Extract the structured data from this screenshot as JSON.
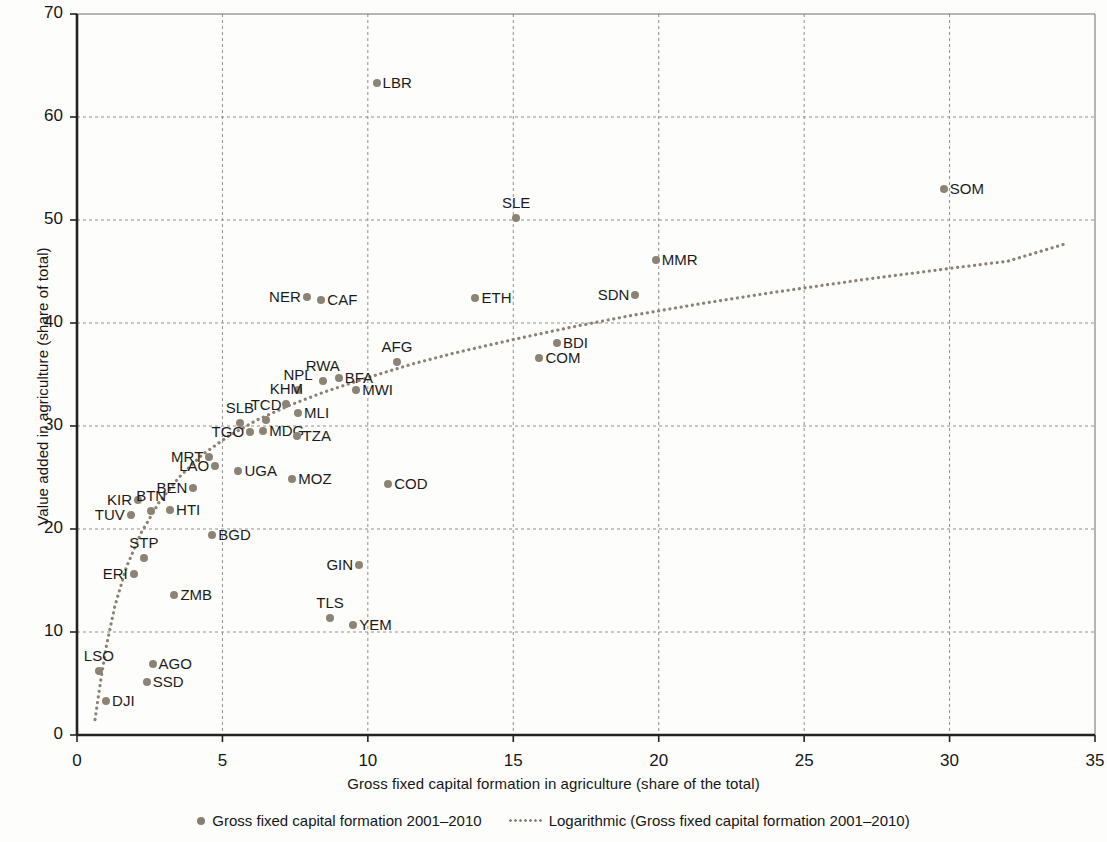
{
  "chart_data": {
    "type": "scatter",
    "title": "",
    "xlabel": "Gross fixed capital formation in agriculture (share of the total)",
    "ylabel": "Value added in agriculture (share of total)",
    "xlim": [
      0,
      35
    ],
    "ylim": [
      0,
      70
    ],
    "xticks": [
      "0",
      "5",
      "10",
      "15",
      "20",
      "25",
      "30",
      "35"
    ],
    "yticks": [
      "0",
      "10",
      "20",
      "30",
      "40",
      "50",
      "60",
      "70"
    ],
    "grid": true,
    "legend_position": "bottom",
    "series_color": "#8d8374",
    "legend": [
      {
        "label": "Gross fixed capital formation 2001–2010",
        "marker": "dot"
      },
      {
        "label": "Logarithmic (Gross fixed capital formation 2001–2010)",
        "marker": "dotted-line"
      }
    ],
    "points": [
      {
        "label": "LBR",
        "x": 10.3,
        "y": 63.3,
        "pos": "r"
      },
      {
        "label": "SOM",
        "x": 29.8,
        "y": 53.0,
        "pos": "r"
      },
      {
        "label": "SLE",
        "x": 15.1,
        "y": 50.2,
        "pos": "top"
      },
      {
        "label": "MMR",
        "x": 19.9,
        "y": 46.1,
        "pos": "r"
      },
      {
        "label": "SDN",
        "x": 19.2,
        "y": 42.7,
        "pos": "l"
      },
      {
        "label": "ETH",
        "x": 13.7,
        "y": 42.4,
        "pos": "r"
      },
      {
        "label": "NER",
        "x": 7.9,
        "y": 42.5,
        "pos": "l"
      },
      {
        "label": "CAF",
        "x": 8.4,
        "y": 42.2,
        "pos": "r"
      },
      {
        "label": "BDI",
        "x": 16.5,
        "y": 38.1,
        "pos": "r"
      },
      {
        "label": "COM",
        "x": 15.9,
        "y": 36.6,
        "pos": "r"
      },
      {
        "label": "AFG",
        "x": 11.0,
        "y": 36.2,
        "pos": "top"
      },
      {
        "label": "RWA",
        "x": 8.45,
        "y": 34.4,
        "pos": "top"
      },
      {
        "label": "BFA",
        "x": 9.0,
        "y": 34.7,
        "pos": "r"
      },
      {
        "label": "NPL",
        "x": 7.6,
        "y": 33.5,
        "pos": "top"
      },
      {
        "label": "MWI",
        "x": 9.6,
        "y": 33.5,
        "pos": "r"
      },
      {
        "label": "KHM",
        "x": 7.2,
        "y": 32.1,
        "pos": "top"
      },
      {
        "label": "MLI",
        "x": 7.6,
        "y": 31.3,
        "pos": "r"
      },
      {
        "label": "TCD",
        "x": 6.5,
        "y": 30.6,
        "pos": "top"
      },
      {
        "label": "SLB",
        "x": 5.6,
        "y": 30.3,
        "pos": "top"
      },
      {
        "label": "MDG",
        "x": 6.4,
        "y": 29.5,
        "pos": "r"
      },
      {
        "label": "TZA",
        "x": 7.55,
        "y": 29.0,
        "pos": "r"
      },
      {
        "label": "TGO",
        "x": 5.95,
        "y": 29.4,
        "pos": "l"
      },
      {
        "label": "MRT",
        "x": 4.55,
        "y": 27.0,
        "pos": "l"
      },
      {
        "label": "LAO",
        "x": 4.75,
        "y": 26.1,
        "pos": "l"
      },
      {
        "label": "UGA",
        "x": 5.55,
        "y": 25.6,
        "pos": "r"
      },
      {
        "label": "MOZ",
        "x": 7.4,
        "y": 24.9,
        "pos": "r"
      },
      {
        "label": "COD",
        "x": 10.7,
        "y": 24.4,
        "pos": "r"
      },
      {
        "label": "BEN",
        "x": 4.0,
        "y": 24.0,
        "pos": "l"
      },
      {
        "label": "KIR",
        "x": 2.1,
        "y": 22.8,
        "pos": "l"
      },
      {
        "label": "BTN",
        "x": 2.55,
        "y": 21.7,
        "pos": "top"
      },
      {
        "label": "HTI",
        "x": 3.2,
        "y": 21.8,
        "pos": "r"
      },
      {
        "label": "TUV",
        "x": 1.85,
        "y": 21.4,
        "pos": "l"
      },
      {
        "label": "BGD",
        "x": 4.65,
        "y": 19.4,
        "pos": "r"
      },
      {
        "label": "STP",
        "x": 2.3,
        "y": 17.2,
        "pos": "top"
      },
      {
        "label": "GIN",
        "x": 9.7,
        "y": 16.5,
        "pos": "l"
      },
      {
        "label": "ERI",
        "x": 1.95,
        "y": 15.6,
        "pos": "l"
      },
      {
        "label": "ZMB",
        "x": 3.35,
        "y": 13.6,
        "pos": "r"
      },
      {
        "label": "TLS",
        "x": 8.7,
        "y": 11.4,
        "pos": "top"
      },
      {
        "label": "YEM",
        "x": 9.5,
        "y": 10.7,
        "pos": "r"
      },
      {
        "label": "AGO",
        "x": 2.6,
        "y": 6.9,
        "pos": "r"
      },
      {
        "label": "LSO",
        "x": 0.75,
        "y": 6.2,
        "pos": "top"
      },
      {
        "label": "SSD",
        "x": 2.4,
        "y": 5.1,
        "pos": "r"
      },
      {
        "label": "DJI",
        "x": 1.0,
        "y": 3.3,
        "pos": "r"
      }
    ],
    "trendline": {
      "type": "logarithmic",
      "label": "Logarithmic (Gross fixed capital formation 2001–2010)",
      "points": [
        {
          "x": 0.62,
          "y": 1.5
        },
        {
          "x": 0.8,
          "y": 5.0
        },
        {
          "x": 1.0,
          "y": 8.5
        },
        {
          "x": 1.3,
          "y": 12.5
        },
        {
          "x": 1.7,
          "y": 16.3
        },
        {
          "x": 2.2,
          "y": 19.6
        },
        {
          "x": 2.8,
          "y": 22.5
        },
        {
          "x": 3.5,
          "y": 25.0
        },
        {
          "x": 4.3,
          "y": 27.2
        },
        {
          "x": 5.2,
          "y": 29.0
        },
        {
          "x": 6.2,
          "y": 30.6
        },
        {
          "x": 7.3,
          "y": 32.0
        },
        {
          "x": 8.5,
          "y": 33.3
        },
        {
          "x": 10.0,
          "y": 34.7
        },
        {
          "x": 11.5,
          "y": 36.0
        },
        {
          "x": 13.0,
          "y": 37.1
        },
        {
          "x": 15.0,
          "y": 38.4
        },
        {
          "x": 17.0,
          "y": 39.6
        },
        {
          "x": 19.0,
          "y": 40.7
        },
        {
          "x": 21.5,
          "y": 41.9
        },
        {
          "x": 24.0,
          "y": 43.0
        },
        {
          "x": 27.0,
          "y": 44.2
        },
        {
          "x": 30.0,
          "y": 45.3
        },
        {
          "x": 32.0,
          "y": 46.0
        },
        {
          "x": 34.0,
          "y": 47.7
        }
      ]
    }
  }
}
